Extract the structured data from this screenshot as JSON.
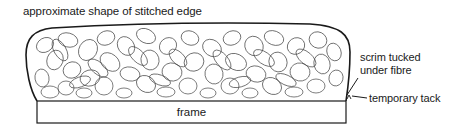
{
  "diagram": {
    "title_label": "approximate shape of stitched edge",
    "annotations": {
      "scrim": {
        "line1": "scrim tucked",
        "line2": "under fibre"
      },
      "tack": "temporary tack"
    },
    "frame_label": "frame",
    "components": [
      {
        "name": "fibre-mass",
        "description": "stitched fibre mass drawn as loose loops"
      },
      {
        "name": "frame",
        "description": "rectangular frame base"
      },
      {
        "name": "scrim",
        "description": "scrim tucked under fibre on right edge"
      },
      {
        "name": "temporary-tack",
        "description": "tack holding scrim to frame"
      }
    ],
    "colors": {
      "stroke": "#1a1a1a",
      "background": "#ffffff"
    }
  }
}
